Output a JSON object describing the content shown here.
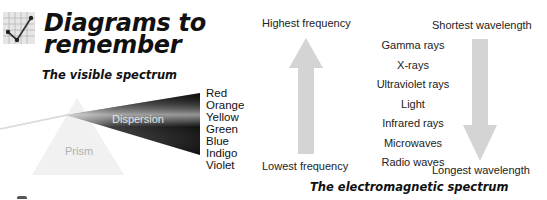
{
  "header": {
    "title_line1": "Diagrams to",
    "title_line2": "remember",
    "icon": "line-chart-check-icon"
  },
  "visible_spectrum": {
    "heading": "The visible spectrum",
    "prism_label": "Prism",
    "dispersion_label": "Dispersion",
    "colors": [
      "Red",
      "Orange",
      "Yellow",
      "Green",
      "Blue",
      "Indigo",
      "Violet"
    ]
  },
  "em_spectrum": {
    "heading": "The electromagnetic spectrum",
    "top_left": "Highest frequency",
    "bottom_left": "Lowest frequency",
    "top_right": "Shortest wavelength",
    "bottom_right": "Longest wavelength",
    "waves": [
      "Gamma rays",
      "X-rays",
      "Ultraviolet rays",
      "Light",
      "Infrared rays",
      "Microwaves",
      "Radio waves"
    ],
    "arrow_color": "#d4d4d4"
  }
}
